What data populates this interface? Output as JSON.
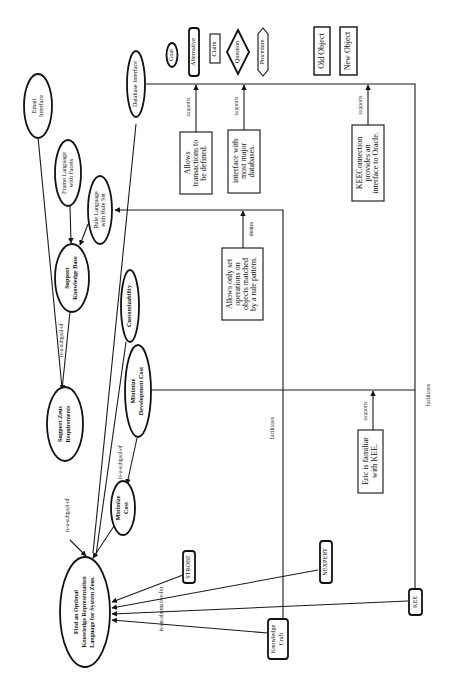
{
  "diagram": {
    "orientation": "rotated-90-ccw",
    "legend": {
      "goal": "Goal",
      "alternative": "Alternative",
      "claim": "Claim",
      "question": "Question",
      "procedure": "Procedure",
      "old_object": "Old Object",
      "new_object": "New Object"
    },
    "goals": {
      "root": [
        "Find an Optimal",
        "Knowledge Representation",
        "Language for System Zeus."
      ],
      "support_zeus": [
        "Support Zeus",
        "Requirements"
      ],
      "support_kb": [
        "Support",
        "Knowledge Base"
      ],
      "email": [
        "Email",
        "Interface"
      ],
      "frame_lang": [
        "Frame Language",
        "with Facets"
      ],
      "rule_lang": [
        "Rule Language",
        "with Rule Set"
      ],
      "database": [
        "Database Interface"
      ],
      "customizability": [
        "Customizability"
      ],
      "min_dev_cost": [
        "Minimize",
        "Development Cost"
      ],
      "min_cost": [
        "Minimize",
        "Cost"
      ]
    },
    "alternatives": {
      "strobe": "STROBE",
      "nexpert": "NEXPERT",
      "knowledge_craft": [
        "Knowledge",
        "Craft"
      ],
      "kee": "KEE"
    },
    "claims": {
      "transactions": [
        "Allows",
        "transactions to",
        "be defined."
      ],
      "interface_db": [
        "interface with",
        "most major",
        "databases."
      ],
      "keeconnection": [
        "KEEConnection",
        "provides an",
        "interface to Oracle."
      ],
      "set_operations": [
        "Allows only set",
        "operations on",
        "objects matched",
        "by a rule pattern."
      ],
      "eric": [
        "Eric is familiar",
        "with KEE."
      ]
    },
    "link_labels": {
      "subgoal": "is-a-subgoal-of",
      "alternative": "is-an-alternative-for",
      "supports": "supports",
      "denies": "denies",
      "facilitates": "facilitates"
    }
  }
}
